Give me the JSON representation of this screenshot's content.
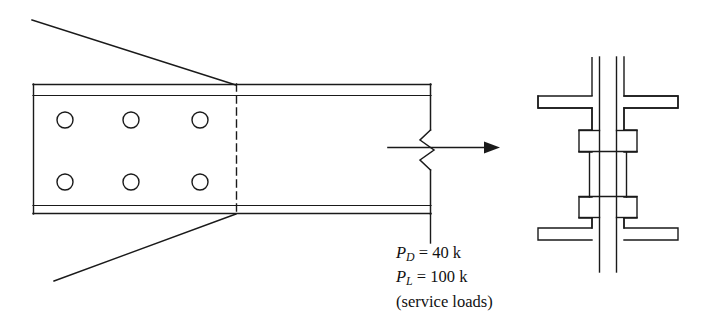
{
  "figure": {
    "stroke_color": "#1a1a1a",
    "background_color": "#ffffff"
  },
  "annotations": {
    "dead_load": {
      "symbol": "P",
      "subscript": "D",
      "equals": " = ",
      "value": "40 k",
      "full_text": "PD = 40 k"
    },
    "live_load": {
      "symbol": "P",
      "subscript": "L",
      "equals": " = ",
      "value": "100 k",
      "full_text": "PL = 100 k"
    },
    "note": "(service loads)"
  },
  "side_view": {
    "label": "beam-splice-elevation",
    "splice_plate": {
      "label": "splice-plate",
      "x": 33,
      "y": 84,
      "width": 203,
      "height": 130
    },
    "bolt_holes": {
      "count": 6,
      "rows": 2,
      "columns": 3,
      "radius": 8,
      "centers_x": [
        65,
        131,
        200
      ],
      "centers_y": [
        120,
        182
      ]
    },
    "faying_line": {
      "label": "dashed-splice-line",
      "x": 236,
      "y_top": 84,
      "y_bottom": 214
    },
    "break_symbol": {
      "label": "beam-break-zigzag",
      "x": 430
    },
    "force_arrow": {
      "label": "applied-load-arrow",
      "x_start": 388,
      "x_end": 500,
      "y": 147
    }
  },
  "cross_section": {
    "label": "beam-cross-section",
    "center_x": 608,
    "top_flange_y": 95,
    "bottom_flange_y": 208,
    "web_top_y": 57,
    "web_bottom_y": 272,
    "flange_splice_plates": 2,
    "web_splice_plates": 2
  }
}
